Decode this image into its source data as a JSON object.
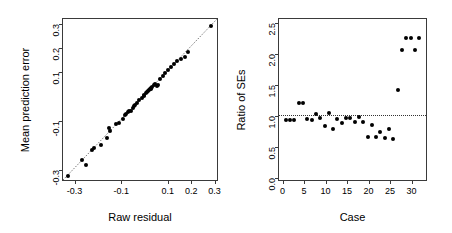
{
  "figure": {
    "background": "#ffffff",
    "point_color": "#000000",
    "axis_color": "#3a3a3a",
    "panel_count": 2
  },
  "chart_data": [
    {
      "id": "left-panel",
      "type": "scatter",
      "title": "",
      "xlabel": "Raw residual",
      "ylabel": "Mean prediction error",
      "xlim": [
        -0.345,
        0.315
      ],
      "ylim": [
        -0.345,
        0.315
      ],
      "xticks": [
        -0.3,
        -0.1,
        0.1,
        0.2,
        0.3
      ],
      "xticklabels": [
        "-0.3",
        "-0.1",
        "0.1",
        "0.2",
        "0.3"
      ],
      "yticks": [
        -0.3,
        -0.1,
        0.1,
        0.2,
        0.3
      ],
      "yticklabels": [
        "-0.3",
        "-0.1",
        "0.1",
        "0.2",
        "0.3"
      ],
      "grid": false,
      "legend": false,
      "reference_line": {
        "type": "identity",
        "style": "dotted",
        "from": [
          -0.345,
          -0.345
        ],
        "to": [
          0.315,
          0.315
        ]
      },
      "x": [
        -0.325,
        -0.262,
        -0.246,
        -0.222,
        -0.212,
        -0.182,
        -0.158,
        -0.146,
        -0.142,
        -0.118,
        -0.104,
        -0.088,
        -0.08,
        -0.074,
        -0.068,
        -0.062,
        -0.054,
        -0.046,
        -0.042,
        -0.036,
        -0.03,
        -0.018,
        -0.008,
        0.0,
        0.004,
        0.01,
        0.014,
        0.018,
        0.022,
        0.026,
        0.03,
        0.034,
        0.038,
        0.044,
        0.05,
        0.056,
        0.062,
        0.07,
        0.082,
        0.094,
        0.106,
        0.118,
        0.13,
        0.144,
        0.162,
        0.178,
        0.192,
        0.288
      ],
      "y": [
        -0.33,
        -0.262,
        -0.282,
        -0.222,
        -0.212,
        -0.2,
        -0.172,
        -0.132,
        -0.146,
        -0.116,
        -0.112,
        -0.096,
        -0.08,
        -0.074,
        -0.068,
        -0.062,
        -0.062,
        -0.048,
        -0.042,
        -0.036,
        -0.03,
        -0.018,
        -0.008,
        0.0,
        0.004,
        0.01,
        0.014,
        0.018,
        0.022,
        0.026,
        0.03,
        0.034,
        0.038,
        0.044,
        0.05,
        0.04,
        0.044,
        0.07,
        0.082,
        0.094,
        0.106,
        0.118,
        0.13,
        0.144,
        0.15,
        0.16,
        0.178,
        0.288
      ]
    },
    {
      "id": "right-panel",
      "type": "scatter",
      "title": "",
      "xlabel": "Case",
      "ylabel": "Ratio of SEs",
      "xlim": [
        -0.6,
        33.6
      ],
      "ylim": [
        -0.05,
        2.55
      ],
      "xticks": [
        0,
        5,
        10,
        15,
        20,
        25,
        30
      ],
      "xticklabels": [
        "0",
        "5",
        "10",
        "15",
        "20",
        "25",
        "30"
      ],
      "yticks": [
        0.0,
        0.5,
        1.0,
        1.5,
        2.0,
        2.5
      ],
      "yticklabels": [
        "0.0",
        "0.5",
        "1.0",
        "1.5",
        "2.0",
        "2.5"
      ],
      "grid": false,
      "legend": false,
      "reference_line": {
        "type": "horizontal",
        "style": "dotted",
        "value": 1.0
      },
      "x": [
        1,
        2,
        3,
        4,
        5,
        6,
        7,
        8,
        9,
        10,
        11,
        12,
        13,
        14,
        15,
        16,
        17,
        18,
        19,
        20,
        21,
        22,
        23,
        24,
        25,
        26,
        27,
        28,
        29,
        30,
        31,
        32
      ],
      "y": [
        0.92,
        0.92,
        0.92,
        1.19,
        1.19,
        0.93,
        0.92,
        1.02,
        0.95,
        0.82,
        1.04,
        0.78,
        0.93,
        0.87,
        0.95,
        0.95,
        0.89,
        0.97,
        0.88,
        0.65,
        0.84,
        0.64,
        0.72,
        0.63,
        0.78,
        0.61,
        1.4,
        2.05,
        2.25,
        2.25,
        2.05,
        2.25
      ]
    }
  ]
}
